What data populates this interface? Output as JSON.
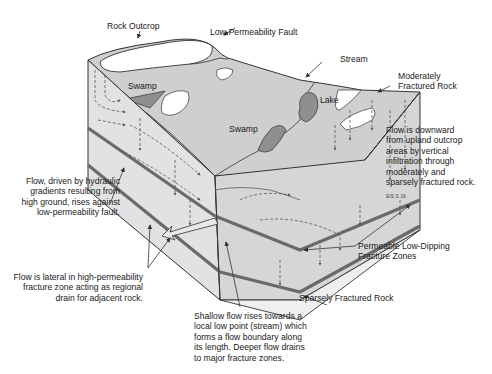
{
  "diagram": {
    "colors": {
      "surface": "#cfcfcf",
      "face_left": "#e2e2e2",
      "face_right": "#d6d6d6",
      "swamp": "#8f8f8f",
      "outcrop": "#ffffff",
      "fracture_zone": "#6a6a6a",
      "line": "#333333"
    },
    "labels": {
      "rock_outcrop": "Rock Outcrop",
      "low_perm_fault": "Low-Permeability Fault",
      "stream": "Stream",
      "moderately_fractured": [
        "Moderately",
        "Fractured Rock"
      ],
      "swamp_upper": "Swamp",
      "swamp_lower": "Swamp",
      "lake": "Lake",
      "flow_downward": [
        "Flow is downward",
        "from upland outcrop",
        "areas by vertical",
        "infiltration through",
        "moderately and",
        "sparsely fractured rock."
      ],
      "figure_code": "EIS S 16",
      "flow_driven": [
        "Flow, driven by hydraulic",
        "gradients resulting from",
        "high ground, rises against",
        "low-permeability fault."
      ],
      "permeable_zones": [
        "Permeable Low-Dipping",
        "Fracture Zones"
      ],
      "flow_lateral": [
        "Flow is lateral in high-permeability",
        "fracture zone acting as regional",
        "drain for adjacent rock."
      ],
      "sparsely_fractured": "Sparsely Fractured Rock",
      "shallow_flow": [
        "Shallow flow rises towards a",
        "local low point (stream) which",
        "forms a flow boundary along",
        "its length. Deeper flow drains",
        "to major fracture zones."
      ]
    }
  }
}
